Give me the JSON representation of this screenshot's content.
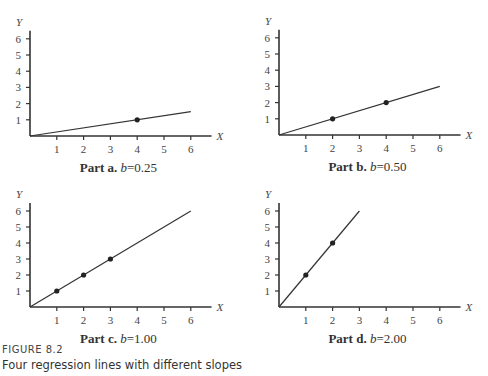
{
  "figure": {
    "label": "FIGURE 8.2",
    "title": "Four regression lines with different slopes"
  },
  "chart_data": [
    {
      "type": "line",
      "panel": "a",
      "title": "Part a. b=0.25",
      "caption_part": "Part a.",
      "caption_b": "b",
      "caption_value": "=0.25",
      "slope": 0.25,
      "intercept": 0,
      "line": {
        "x": [
          0,
          6
        ],
        "y": [
          0,
          1.5
        ]
      },
      "points": [
        {
          "x": 4,
          "y": 1
        }
      ],
      "xlabel": "X",
      "ylabel": "Y",
      "xticks": [
        1,
        2,
        3,
        4,
        5,
        6
      ],
      "yticks": [
        1,
        2,
        3,
        4,
        5,
        6
      ],
      "xlim": [
        0,
        6.7
      ],
      "ylim": [
        0,
        6.5
      ],
      "grid": false
    },
    {
      "type": "line",
      "panel": "b",
      "title": "Part b. b=0.50",
      "caption_part": "Part b.",
      "caption_b": "b",
      "caption_value": "=0.50",
      "slope": 0.5,
      "intercept": 0,
      "line": {
        "x": [
          0,
          6
        ],
        "y": [
          0,
          3
        ]
      },
      "points": [
        {
          "x": 2,
          "y": 1
        },
        {
          "x": 4,
          "y": 2
        }
      ],
      "xlabel": "X",
      "ylabel": "Y",
      "xticks": [
        1,
        2,
        3,
        4,
        5,
        6
      ],
      "yticks": [
        1,
        2,
        3,
        4,
        5,
        6
      ],
      "xlim": [
        0,
        6.7
      ],
      "ylim": [
        0,
        6.5
      ],
      "grid": false
    },
    {
      "type": "line",
      "panel": "c",
      "title": "Part c. b=1.00",
      "caption_part": "Part c.",
      "caption_b": "b",
      "caption_value": "=1.00",
      "slope": 1.0,
      "intercept": 0,
      "line": {
        "x": [
          0,
          6
        ],
        "y": [
          0,
          6
        ]
      },
      "points": [
        {
          "x": 1,
          "y": 1
        },
        {
          "x": 2,
          "y": 2
        },
        {
          "x": 3,
          "y": 3
        }
      ],
      "xlabel": "X",
      "ylabel": "Y",
      "xticks": [
        1,
        2,
        3,
        4,
        5,
        6
      ],
      "yticks": [
        1,
        2,
        3,
        4,
        5,
        6
      ],
      "xlim": [
        0,
        6.7
      ],
      "ylim": [
        0,
        6.5
      ],
      "grid": false
    },
    {
      "type": "line",
      "panel": "d",
      "title": "Part d. b=2.00",
      "caption_part": "Part d.",
      "caption_b": "b",
      "caption_value": "=2.00",
      "slope": 2.0,
      "intercept": 0,
      "line": {
        "x": [
          0,
          3
        ],
        "y": [
          0,
          6
        ]
      },
      "points": [
        {
          "x": 1,
          "y": 2
        },
        {
          "x": 2,
          "y": 4
        }
      ],
      "xlabel": "X",
      "ylabel": "Y",
      "xticks": [
        1,
        2,
        3,
        4,
        5,
        6
      ],
      "yticks": [
        1,
        2,
        3,
        4,
        5,
        6
      ],
      "xlim": [
        0,
        6.7
      ],
      "ylim": [
        0,
        6.5
      ],
      "grid": false
    }
  ],
  "colors": {
    "axis": "#333333",
    "line": "#333333",
    "point": "#222222",
    "text": "#444444"
  }
}
